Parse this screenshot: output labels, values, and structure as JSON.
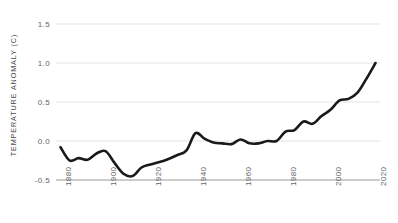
{
  "chart_data": {
    "type": "line",
    "title": "",
    "xlabel": "",
    "ylabel": "TEMPERATURE ANOMALY (C)",
    "xlim": [
      1878,
      2022
    ],
    "ylim": [
      -0.5,
      1.5
    ],
    "grid": true,
    "legend": false,
    "line_color": "#1a1a1a",
    "grid_color": "#e3e3e3",
    "axis_color": "#9a9a9a",
    "yticks": [
      "1.5",
      "1.0",
      "0.5",
      "0.0",
      "-0.5"
    ],
    "ytick_values": [
      1.5,
      1.0,
      0.5,
      0.0,
      -0.5
    ],
    "xticks": [
      "1880",
      "1900",
      "1920",
      "1940",
      "1960",
      "1980",
      "2000",
      "2020"
    ],
    "xtick_values": [
      1880,
      1900,
      1920,
      1940,
      1960,
      1980,
      2000,
      2020
    ],
    "x": [
      1880,
      1884,
      1888,
      1892,
      1896,
      1900,
      1904,
      1908,
      1912,
      1916,
      1920,
      1924,
      1928,
      1932,
      1936,
      1940,
      1944,
      1948,
      1952,
      1956,
      1960,
      1964,
      1968,
      1972,
      1976,
      1980,
      1984,
      1988,
      1992,
      1996,
      2000,
      2004,
      2008,
      2012,
      2016,
      2020
    ],
    "values": [
      -0.08,
      -0.25,
      -0.22,
      -0.24,
      -0.16,
      -0.13,
      -0.28,
      -0.42,
      -0.45,
      -0.34,
      -0.3,
      -0.27,
      -0.23,
      -0.18,
      -0.12,
      0.1,
      0.03,
      -0.02,
      -0.03,
      -0.04,
      0.02,
      -0.03,
      -0.03,
      0.0,
      0.0,
      0.12,
      0.14,
      0.25,
      0.22,
      0.32,
      0.4,
      0.52,
      0.54,
      0.62,
      0.8,
      1.0
    ]
  },
  "axes": {
    "y_title": "TEMPERATURE ANOMALY (C)"
  }
}
